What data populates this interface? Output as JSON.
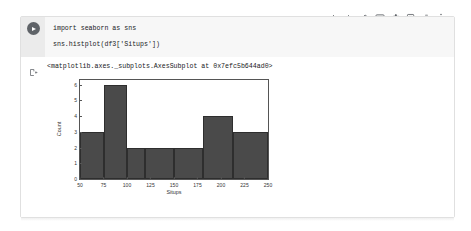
{
  "toolbar": {
    "icons": [
      {
        "name": "move-cell-up-icon",
        "label": "Move cell up"
      },
      {
        "name": "move-cell-down-icon",
        "label": "Move cell down"
      },
      {
        "name": "link-to-cell-icon",
        "label": "Link to cell"
      },
      {
        "name": "mirror-cell-in-tab-icon",
        "label": "Mirror cell in tab"
      },
      {
        "name": "cell-settings-gear-icon",
        "label": "Cell settings"
      },
      {
        "name": "add-comment-icon",
        "label": "Add a comment"
      },
      {
        "name": "delete-cell-icon",
        "label": "Delete cell"
      },
      {
        "name": "more-options-icon",
        "label": "More cell actions"
      }
    ]
  },
  "cell": {
    "run_button_label": "Run cell",
    "code_lines": [
      "import seaborn as sns",
      "sns.histplot(df3['Situps'])"
    ],
    "output_prefix_icon": "output-cell-icon",
    "output_repr": "<matplotlib.axes._subplots.AxesSubplot at 0x7efc5b644ad0>"
  },
  "chart_data": {
    "type": "bar",
    "title": "",
    "xlabel": "Situps",
    "ylabel": "Count",
    "xlim": [
      50,
      250
    ],
    "ylim": [
      0,
      6.3
    ],
    "xticks": [
      "50",
      "75",
      "100",
      "125",
      "150",
      "175",
      "200",
      "225",
      "250"
    ],
    "xtick_values": [
      50,
      75,
      100,
      125,
      150,
      175,
      200,
      225,
      250
    ],
    "yticks": [
      "0",
      "1",
      "2",
      "3",
      "4",
      "5",
      "6"
    ],
    "ytick_values": [
      0,
      1,
      2,
      3,
      4,
      5,
      6
    ],
    "grid": false,
    "legend": false,
    "bar_color": "#4a4a4a",
    "bins": [
      {
        "start": 50,
        "end": 75,
        "count": 3
      },
      {
        "start": 75,
        "end": 100,
        "count": 6
      },
      {
        "start": 100,
        "end": 118.75,
        "count": 2
      },
      {
        "start": 118.75,
        "end": 150,
        "count": 2
      },
      {
        "start": 150,
        "end": 181.25,
        "count": 2
      },
      {
        "start": 181.25,
        "end": 212.5,
        "count": 4
      },
      {
        "start": 212.5,
        "end": 250,
        "count": 3
      }
    ],
    "categories": [
      "50-75",
      "75-100",
      "100-118.75",
      "118.75-150",
      "150-181.25",
      "181.25-212.5",
      "212.5-250"
    ],
    "values": [
      3,
      6,
      2,
      2,
      2,
      4,
      3
    ]
  }
}
